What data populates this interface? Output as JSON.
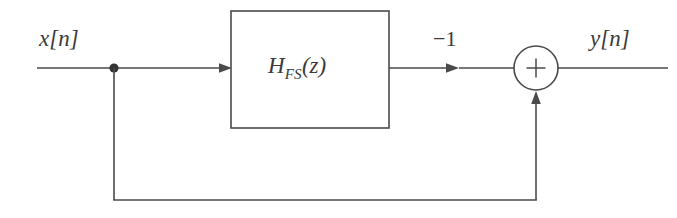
{
  "diagram": {
    "type": "block-diagram",
    "background_color": "#ffffff",
    "line_color": "#4a4a4a",
    "text_color": "#3a3a3a",
    "line_width": 1.6,
    "labels": {
      "input_signal": "x[n]",
      "output_signal": "y[n]",
      "gain": "−1",
      "block_main": "H",
      "block_subscript": "FS",
      "block_argument": "(z)",
      "block_full": "H_FS(z)",
      "summer_operator": "+"
    },
    "nodes": {
      "input_line": {
        "x1": 37,
        "y1": 68,
        "x2": 114,
        "y2": 68
      },
      "junction_dot": {
        "cx": 114,
        "cy": 68,
        "r": 4.6
      },
      "junction_to_block": {
        "x1": 114,
        "y1": 68,
        "x2": 232,
        "y2": 68
      },
      "block": {
        "x": 231,
        "y": 11,
        "width": 158,
        "height": 117
      },
      "block_to_summer": {
        "x1": 389,
        "y1": 68,
        "x2": 514,
        "y2": 68
      },
      "summer_circle": {
        "cx": 536,
        "cy": 68,
        "r": 22
      },
      "summer_plus": {
        "size": 19
      },
      "output_line": {
        "x1": 558,
        "y1": 68,
        "x2": 668,
        "y2": 68
      },
      "feedback_down": {
        "x1": 114,
        "y1": 68,
        "x2": 114,
        "y2": 200
      },
      "feedback_across": {
        "x1": 114,
        "y1": 200,
        "x2": 536,
        "y2": 200
      },
      "feedback_up": {
        "x1": 536,
        "y1": 200,
        "x2": 536,
        "y2": 92
      }
    },
    "arrowheads": [
      {
        "name": "arrow-into-block",
        "x": 232,
        "y": 68,
        "direction": "right"
      },
      {
        "name": "arrow-after-block",
        "x": 459,
        "y": 68,
        "direction": "right"
      },
      {
        "name": "arrow-into-summer",
        "x": 536,
        "y": 91,
        "direction": "up"
      }
    ]
  }
}
